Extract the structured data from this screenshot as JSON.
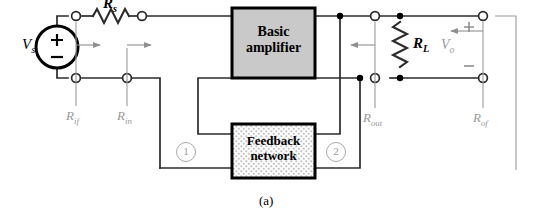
{
  "figure": {
    "caption": "(a)",
    "type": "circuit-diagram"
  },
  "blocks": [
    {
      "id": "basic-amplifier",
      "line1": "Basic",
      "line2": "amplifier",
      "fill": "#c9c9c9",
      "border": "#000000"
    },
    {
      "id": "feedback-network",
      "line1": "Feedback",
      "line2": "network",
      "fill": "#f2f2f2",
      "border": "#000000"
    }
  ],
  "source": {
    "label": "V",
    "subscript": "s",
    "plus": "+",
    "minus": "−"
  },
  "components": [
    {
      "id": "source-resistor",
      "label": "R",
      "subscript": "s",
      "orientation": "horizontal"
    },
    {
      "id": "load-resistor",
      "label": "R",
      "subscript": "L",
      "orientation": "vertical"
    }
  ],
  "output": {
    "label": "V",
    "subscript": "o",
    "plus": "+",
    "minus": "−"
  },
  "resistance_labels": [
    {
      "id": "r-if",
      "label": "R",
      "subscript": "if",
      "color": "#9a9a9a"
    },
    {
      "id": "r-in",
      "label": "R",
      "subscript": "in",
      "color": "#9a9a9a"
    },
    {
      "id": "r-out",
      "label": "R",
      "subscript": "out",
      "color": "#9a9a9a"
    },
    {
      "id": "r-of",
      "label": "R",
      "subscript": "of",
      "color": "#9a9a9a"
    }
  ],
  "port_markers": [
    {
      "id": "port-1",
      "text": "1"
    },
    {
      "id": "port-2",
      "text": "2"
    }
  ],
  "colors": {
    "wire": "#2b2b2b",
    "annotation": "#9a9a9a",
    "amplifier_fill": "#c9c9c9",
    "feedback_fill": "#f2f2f2",
    "background": "#ffffff"
  }
}
